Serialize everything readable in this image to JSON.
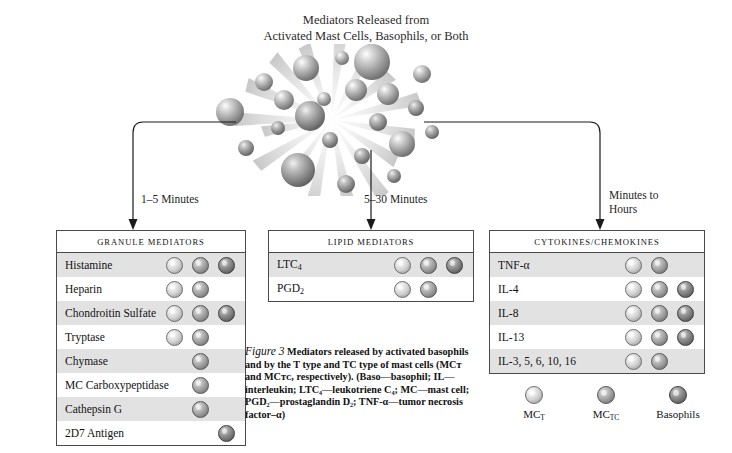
{
  "title": {
    "line1": "Mediators Released from",
    "line2": "Activated Mast Cells, Basophils, or Both"
  },
  "timing": {
    "left": "1–5 Minutes",
    "middle": "5–30 Minutes",
    "right": "Minutes to\nHours"
  },
  "legend": {
    "items": [
      {
        "label": "MC",
        "sub": "T",
        "type": "t",
        "name": "mc-t"
      },
      {
        "label": "MC",
        "sub": "TC",
        "type": "tc",
        "name": "mc-tc"
      },
      {
        "label": "Basophils",
        "sub": "",
        "type": "baso",
        "name": "basophils"
      }
    ]
  },
  "panels": [
    {
      "id": "granule",
      "header": "Granule Mediators",
      "rows": [
        {
          "label": "Histamine",
          "sub": "",
          "cells": [
            "t",
            "tc",
            "baso"
          ]
        },
        {
          "label": "Heparin",
          "sub": "",
          "cells": [
            "t",
            "tc",
            ""
          ]
        },
        {
          "label": "Chondroitin Sulfate",
          "sub": "",
          "cells": [
            "t",
            "tc",
            "baso"
          ]
        },
        {
          "label": "Tryptase",
          "sub": "",
          "cells": [
            "t",
            "tc",
            ""
          ]
        },
        {
          "label": "Chymase",
          "sub": "",
          "cells": [
            "",
            "tc",
            ""
          ]
        },
        {
          "label": "MC Carboxypeptidase",
          "sub": "",
          "cells": [
            "",
            "tc",
            ""
          ]
        },
        {
          "label": "Cathepsin G",
          "sub": "",
          "cells": [
            "",
            "tc",
            ""
          ]
        },
        {
          "label": "2D7 Antigen",
          "sub": "",
          "cells": [
            "",
            "",
            "baso"
          ]
        }
      ]
    },
    {
      "id": "lipid",
      "header": "Lipid Mediators",
      "rows": [
        {
          "label": "LTC",
          "sub": "4",
          "cells": [
            "t",
            "tc",
            "baso"
          ]
        },
        {
          "label": "PGD",
          "sub": "2",
          "cells": [
            "t",
            "tc",
            ""
          ]
        }
      ]
    },
    {
      "id": "cytokine",
      "header": "Cytokines/Chemokines",
      "rows": [
        {
          "label": "TNF-α",
          "sub": "",
          "cells": [
            "t",
            "tc",
            ""
          ]
        },
        {
          "label": "IL-4",
          "sub": "",
          "cells": [
            "t",
            "tc",
            "baso"
          ]
        },
        {
          "label": "IL-8",
          "sub": "",
          "cells": [
            "t",
            "tc",
            "baso"
          ]
        },
        {
          "label": "IL-13",
          "sub": "",
          "cells": [
            "t",
            "tc",
            "baso"
          ]
        },
        {
          "label": "IL-3, 5, 6, 10, 16",
          "sub": "",
          "cells": [
            "t",
            "tc",
            ""
          ]
        }
      ]
    }
  ],
  "caption": {
    "figure_number": "Figure 3",
    "text": "Mediators released by activated basophils and by the T type and TC type of mast cells (MCᴛ and MCᴛᴄ, respectively). (Baso—basophil; IL—interleukin; LTC₄—leukotriene C₄; MC—mast cell; PGD₂—prostaglandin D₂; TNF-α—tumor necrosis factor–α)"
  },
  "colors": {
    "mc_t": "#d2d2d2",
    "mc_tc": "#a0a0a0",
    "basophil": "#848484",
    "row_shade": "#e2e2e2",
    "border": "#4a4a4a"
  }
}
